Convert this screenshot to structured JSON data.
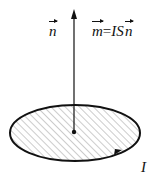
{
  "diagram": {
    "type": "magnetic-moment-of-current-loop",
    "normal_label": "n",
    "moment_lhs": "m",
    "moment_eq": "=",
    "moment_rhs_scalar": "IS",
    "moment_rhs_vec": "n",
    "current_label": "I",
    "colors": {
      "stroke": "#111111",
      "hatch": "#9a9a9a",
      "background": "#ffffff"
    },
    "geometry": {
      "ellipse_center": [
        75,
        133
      ],
      "ellipse_radii": [
        65,
        28
      ],
      "arrow_from": [
        74,
        132
      ],
      "arrow_to": [
        74,
        10
      ]
    }
  }
}
